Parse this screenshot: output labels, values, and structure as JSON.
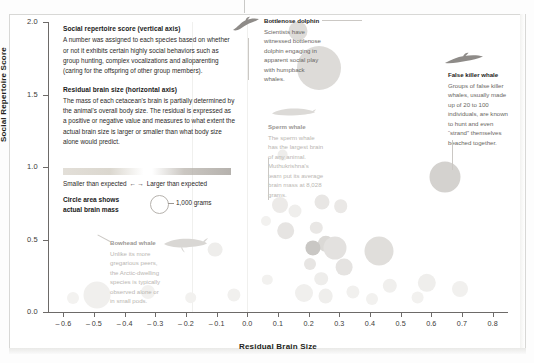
{
  "chart_data": {
    "type": "scatter",
    "title": "",
    "xlabel": "Residual Brain Size",
    "ylabel": "Social Repertoire Score",
    "xlim": [
      -0.65,
      0.85
    ],
    "ylim": [
      0.0,
      2.0
    ],
    "grid": false,
    "legend_position": "upper-left-inset",
    "x_ticks": [
      "-0.6",
      "-0.5",
      "-0.4",
      "-0.3",
      "-0.2",
      "-0.1",
      "0.0",
      "0.1",
      "0.2",
      "0.3",
      "0.4",
      "0.5",
      "0.6",
      "0.7",
      "0.8"
    ],
    "x_tick_values": [
      -0.6,
      -0.5,
      -0.4,
      -0.3,
      -0.2,
      -0.1,
      0.0,
      0.1,
      0.2,
      0.3,
      0.4,
      0.5,
      0.6,
      0.7,
      0.8
    ],
    "y_ticks": [
      "0.0",
      "0.5",
      "1.0",
      "1.5",
      "2.0"
    ],
    "y_tick_values": [
      0.0,
      0.5,
      1.0,
      1.5,
      2.0
    ],
    "size_encoding": "Circle area shows actual brain mass",
    "size_reference_label": "1,000 grams",
    "size_reference_grams": 1000,
    "points": [
      {
        "name": "bottlenose-dolphin",
        "x": 0.165,
        "y": 1.94,
        "brain_grams": 1500,
        "r": 9.5,
        "shade": "#dedcd9"
      },
      {
        "name": "false-killer-whale",
        "x": 0.645,
        "y": 0.93,
        "brain_grams": 3650,
        "r": 15.5,
        "shade": "#d4d2cf"
      },
      {
        "name": "sperm-whale",
        "x": 0.235,
        "y": 1.68,
        "brain_grams": 8028,
        "r": 22.0,
        "shade": "#dddbd8"
      },
      {
        "name": "bowhead-whale",
        "x": -0.49,
        "y": 0.12,
        "brain_grams": 2700,
        "r": 13.5,
        "shade": "#f0efed"
      },
      {
        "name": "species-a",
        "x": 0.105,
        "y": 0.74,
        "brain_grams": 900,
        "r": 8.0,
        "shade": "#eceae8"
      },
      {
        "name": "species-b",
        "x": 0.155,
        "y": 0.7,
        "brain_grams": 700,
        "r": 6.5,
        "shade": "#efeeec"
      },
      {
        "name": "species-c",
        "x": 0.245,
        "y": 0.76,
        "brain_grams": 800,
        "r": 7.5,
        "shade": "#e8e6e4"
      },
      {
        "name": "species-d",
        "x": 0.305,
        "y": 0.73,
        "brain_grams": 700,
        "r": 6.8,
        "shade": "#eae8e6"
      },
      {
        "name": "species-e",
        "x": 0.06,
        "y": 0.63,
        "brain_grams": 400,
        "r": 5.0,
        "shade": "#f2f1ef"
      },
      {
        "name": "species-f",
        "x": 0.125,
        "y": 0.56,
        "brain_grams": 1100,
        "r": 8.8,
        "shade": "#e6e4e2"
      },
      {
        "name": "species-g",
        "x": 0.225,
        "y": 0.58,
        "brain_grams": 600,
        "r": 6.2,
        "shade": "#e9e7e5"
      },
      {
        "name": "species-h",
        "x": 0.255,
        "y": 0.47,
        "brain_grams": 900,
        "r": 8.2,
        "shade": "#dbd9d6"
      },
      {
        "name": "species-i",
        "x": 0.215,
        "y": 0.44,
        "brain_grams": 800,
        "r": 7.6,
        "shade": "#c9c7c4"
      },
      {
        "name": "species-j",
        "x": 0.285,
        "y": 0.44,
        "brain_grams": 1400,
        "r": 11.5,
        "shade": "#e3e1df"
      },
      {
        "name": "species-k",
        "x": 0.43,
        "y": 0.42,
        "brain_grams": 2100,
        "r": 14.5,
        "shade": "#e0dedb"
      },
      {
        "name": "species-l",
        "x": -0.105,
        "y": 0.43,
        "brain_grams": 800,
        "r": 7.4,
        "shade": "#eeedeb"
      },
      {
        "name": "species-m",
        "x": 0.205,
        "y": 0.33,
        "brain_grams": 600,
        "r": 6.0,
        "shade": "#e7e5e3"
      },
      {
        "name": "species-n",
        "x": 0.315,
        "y": 0.31,
        "brain_grams": 900,
        "r": 8.4,
        "shade": "#e5e3e1"
      },
      {
        "name": "species-o",
        "x": 0.24,
        "y": 0.23,
        "brain_grams": 700,
        "r": 6.8,
        "shade": "#eeedeb"
      },
      {
        "name": "species-p",
        "x": 0.185,
        "y": 0.13,
        "brain_grams": 1000,
        "r": 9.0,
        "shade": "#f0efed"
      },
      {
        "name": "species-q",
        "x": 0.255,
        "y": 0.11,
        "brain_grams": 800,
        "r": 7.4,
        "shade": "#efeeec"
      },
      {
        "name": "species-r",
        "x": 0.345,
        "y": 0.14,
        "brain_grams": 700,
        "r": 6.6,
        "shade": "#f1f0ee"
      },
      {
        "name": "species-s",
        "x": 0.465,
        "y": 0.18,
        "brain_grams": 800,
        "r": 7.2,
        "shade": "#f0efed"
      },
      {
        "name": "species-t",
        "x": 0.585,
        "y": 0.2,
        "brain_grams": 1100,
        "r": 9.2,
        "shade": "#efeeec"
      },
      {
        "name": "species-u",
        "x": 0.695,
        "y": 0.16,
        "brain_grams": 900,
        "r": 8.0,
        "shade": "#f1f0ee"
      },
      {
        "name": "species-v",
        "x": 0.555,
        "y": 0.1,
        "brain_grams": 700,
        "r": 6.4,
        "shade": "#f2f1ef"
      },
      {
        "name": "species-w",
        "x": -0.045,
        "y": 0.12,
        "brain_grams": 700,
        "r": 6.6,
        "shade": "#f1f0ee"
      },
      {
        "name": "species-x",
        "x": -0.185,
        "y": 0.1,
        "brain_grams": 600,
        "r": 5.8,
        "shade": "#f2f1ef"
      },
      {
        "name": "species-y",
        "x": -0.325,
        "y": 0.14,
        "brain_grams": 800,
        "r": 7.0,
        "shade": "#f2f1ef"
      },
      {
        "name": "species-z",
        "x": -0.57,
        "y": 0.1,
        "brain_grams": 600,
        "r": 6.0,
        "shade": "#f3f2f0"
      },
      {
        "name": "species-aa",
        "x": 0.065,
        "y": 0.22,
        "brain_grams": 500,
        "r": 5.2,
        "shade": "#f2f1ef"
      },
      {
        "name": "species-ab",
        "x": 0.405,
        "y": 0.09,
        "brain_grams": 600,
        "r": 6.0,
        "shade": "#f2f1ef"
      },
      {
        "name": "species-ac",
        "x": 0.115,
        "y": 1.08,
        "brain_grams": 500,
        "r": 5.4,
        "shade": "#eeedeb"
      }
    ]
  },
  "axes": {
    "y_label": "Social Repertoire Score",
    "x_label": "Residual Brain Size"
  },
  "description": {
    "vertical_heading": "Social repertoire score (vertical axis)",
    "vertical_body": "A number was assigned to each species based on whether or not it exhibits certain highly social behaviors such as group hunting, complex vocalizations and alloparenting (caring for the offspring of other group members).",
    "horizontal_heading": "Residual brain size (horizontal axis)",
    "horizontal_body": "The mass of each cetacean's brain is partially determined by the animal's overall body size. The residual is expressed as a positive or negative value and measures to what extent the actual brain size is larger or smaller than what body size alone would predict."
  },
  "legend": {
    "gradient_left": "Smaller than expected",
    "gradient_arrows": "← →",
    "gradient_right": "Larger than expected",
    "circle_title_line1": "Circle area shows",
    "circle_title_line2": "actual brain mass",
    "circle_value": "1,000 grams"
  },
  "annotations": [
    {
      "id": "bottlenose-dolphin",
      "title": "Bottlenose dolphin",
      "body": "Scientists have witnessed bottlenose dolphin engaging in apparent social play with humpback whales.",
      "silhouette": "dolphin-silhouette"
    },
    {
      "id": "sperm-whale",
      "title": "Sperm whale",
      "body": "The sperm whale has the largest brain of any animal. Muthukrishna's team put its average brain mass at 8,028 grams.",
      "silhouette": "sperm-whale-silhouette"
    },
    {
      "id": "false-killer-whale",
      "title": "False killer whale",
      "body": "Groups of false killer whales, usually made up of 20 to 100 individuals, are known to hunt and even “strand” themselves beached together.",
      "silhouette": "false-killer-whale-silhouette"
    },
    {
      "id": "bowhead-whale",
      "title": "Bowhead whale",
      "body": "Unlike its more gregarious peers, the Arctic-dwelling species is typically observed alone or in small pods.",
      "silhouette": "bowhead-whale-silhouette"
    }
  ]
}
